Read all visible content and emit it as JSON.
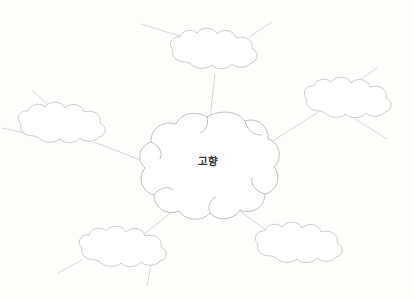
{
  "page": {
    "background_color": "#fdfdfc",
    "ink_color": "#c9c9cc",
    "text_color": "#3a3a3c"
  },
  "center": {
    "label": "고향",
    "name": "center-cloud",
    "cx": 208,
    "cy": 161
  },
  "branches": [
    {
      "id": "top",
      "label": "",
      "name": "cloud-top",
      "cx": 219,
      "cy": 52,
      "rx": 43,
      "ry": 20,
      "connector": [
        210,
        119,
        215,
        74
      ],
      "stubs": [
        [
          186,
          38,
          141,
          24
        ],
        [
          249,
          37,
          272,
          22
        ]
      ]
    },
    {
      "id": "left",
      "label": "",
      "name": "cloud-left",
      "cx": 65,
      "cy": 126,
      "rx": 42,
      "ry": 19,
      "connector": [
        148,
        163,
        94,
        142
      ],
      "stubs": [
        [
          55,
          111,
          32,
          90
        ]
      ]
    },
    {
      "id": "right",
      "label": "",
      "name": "cloud-right",
      "cx": 352,
      "cy": 101,
      "rx": 43,
      "ry": 19,
      "connector": [
        268,
        144,
        317,
        113
      ],
      "stubs": [
        [
          352,
          86,
          378,
          67
        ],
        [
          355,
          119,
          387,
          139
        ]
      ]
    },
    {
      "id": "left-lower",
      "label": "",
      "name": "cloud-left-lower",
      "cx": 41,
      "cy": 133,
      "rx": 0,
      "ry": 0,
      "connector": [
        0,
        0,
        0,
        0
      ],
      "stubs": [
        [
          25,
          133,
          2,
          128
        ]
      ]
    },
    {
      "id": "bottom-left",
      "label": "",
      "name": "cloud-bottom-left",
      "cx": 126,
      "cy": 250,
      "rx": 42,
      "ry": 19,
      "connector": [
        178,
        207,
        143,
        235
      ],
      "stubs": [
        [
          82,
          260,
          58,
          273
        ],
        [
          151,
          265,
          147,
          286
        ]
      ]
    },
    {
      "id": "bottom-right",
      "label": "",
      "name": "cloud-bottom-right",
      "cx": 302,
      "cy": 246,
      "rx": 42,
      "ry": 19,
      "connector": [
        233,
        206,
        273,
        235
      ],
      "stubs": []
    }
  ],
  "legend": {
    "instruction": ""
  }
}
